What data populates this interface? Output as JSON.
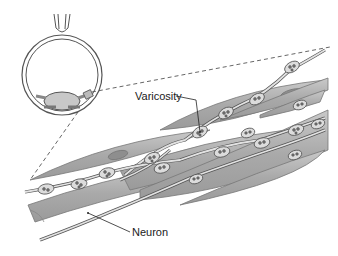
{
  "diagram": {
    "type": "anatomical-illustration",
    "labels": {
      "varicosity": "Varicosity",
      "neuron": "Neuron"
    },
    "colors": {
      "muscle_fill": "#b3b3b3",
      "muscle_nucleus": "#8e8e8e",
      "neuron_fill": "#d9d9d9",
      "outline": "#555555",
      "lens": "#c8c8c8",
      "background": "#ffffff"
    }
  }
}
